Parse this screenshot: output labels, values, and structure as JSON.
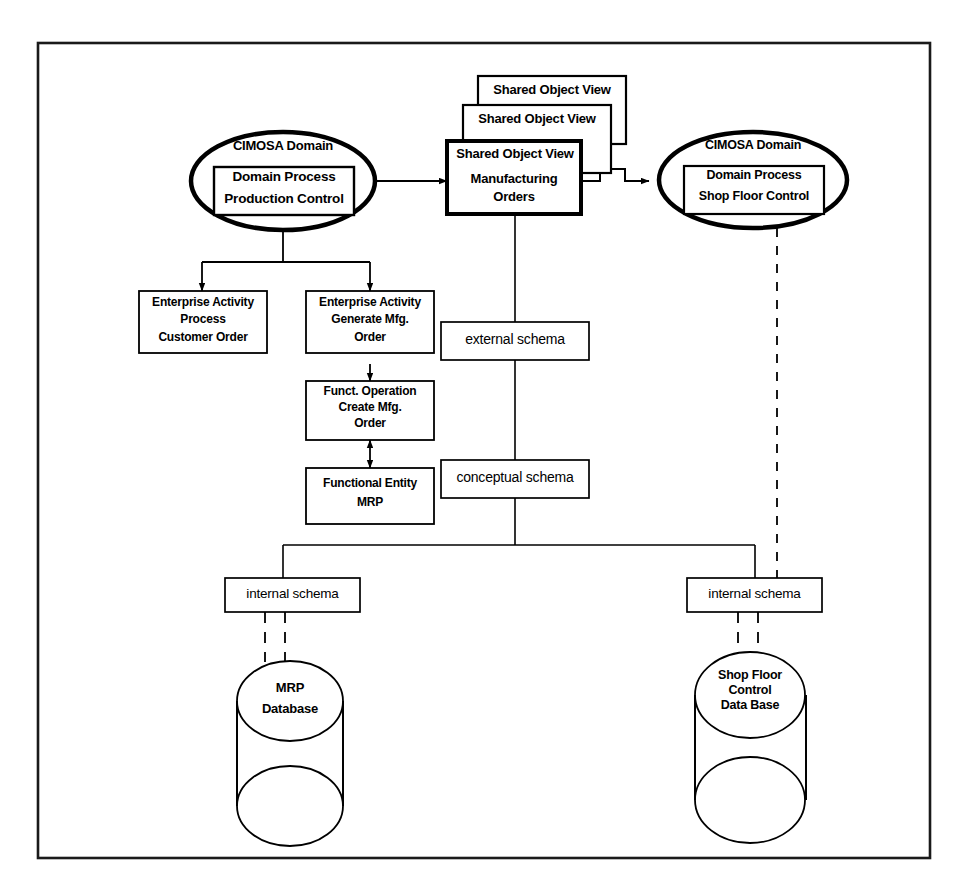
{
  "diagram": {
    "frame": {
      "stroke": "#1a1a1a"
    },
    "nodes": {
      "production_control_domain": {
        "type": "ellipse",
        "caption": "CIMOSA Domain",
        "inner_line1": "Domain Process",
        "inner_line2": "Production Control"
      },
      "shop_floor_domain": {
        "type": "ellipse",
        "caption": "CIMOSA Domain",
        "inner_line1": "Domain Process",
        "inner_line2": "Shop Floor Control"
      },
      "shared_object_view_back": {
        "type": "box",
        "label": "Shared Object View"
      },
      "shared_object_view_mid": {
        "type": "box",
        "label": "Shared Object View"
      },
      "shared_object_view_front": {
        "type": "box",
        "label": "Shared Object View",
        "line1": "Manufacturing",
        "line2": "Orders"
      },
      "enterprise_activity_customer_order": {
        "type": "box",
        "line1": "Enterprise Activity",
        "line2": "Process",
        "line3": "Customer Order"
      },
      "enterprise_activity_generate_mfg_order": {
        "type": "box",
        "line1": "Enterprise Activity",
        "line2": "Generate Mfg.",
        "line3": "Order"
      },
      "funct_operation_create_mfg_order": {
        "type": "box",
        "line1": "Funct. Operation",
        "line2": "Create Mfg.",
        "line3": "Order"
      },
      "functional_entity_mrp": {
        "type": "box",
        "line1": "Functional Entity",
        "line2": "MRP"
      },
      "external_schema_label": {
        "type": "label-box",
        "label": "external schema"
      },
      "conceptual_schema_label": {
        "type": "label-box",
        "label": "conceptual schema"
      },
      "internal_schema_label_left": {
        "type": "label-box",
        "label": "internal schema"
      },
      "internal_schema_label_right": {
        "type": "label-box",
        "label": "internal schema"
      },
      "mrp_database": {
        "type": "cylinder",
        "line1": "MRP",
        "line2": "Database"
      },
      "shop_floor_control_database": {
        "type": "cylinder",
        "line1": "Shop Floor",
        "line2": "Control",
        "line3": "Data Base"
      }
    },
    "connectors": [
      {
        "name": "production-control-to-manufacturing-orders",
        "style": "solid-arrow"
      },
      {
        "name": "manufacturing-orders-to-shop-floor-control",
        "style": "solid-arrow"
      },
      {
        "name": "production-control-fork-to-enterprise-activities",
        "style": "solid-arrow"
      },
      {
        "name": "generate-mfg-order-to-funct-operation",
        "style": "solid-arrow"
      },
      {
        "name": "funct-operation-to-functional-entity",
        "style": "double-arrow"
      },
      {
        "name": "shared-object-view-schema-spine",
        "style": "solid-line"
      },
      {
        "name": "schema-spine-fork-to-internal-schemas",
        "style": "solid-line"
      },
      {
        "name": "shop-floor-domain-to-internal-schema",
        "style": "dashed-line"
      },
      {
        "name": "internal-schema-left-to-mrp-database",
        "style": "dashed-line"
      },
      {
        "name": "internal-schema-right-to-shop-floor-database",
        "style": "dashed-line"
      }
    ]
  }
}
